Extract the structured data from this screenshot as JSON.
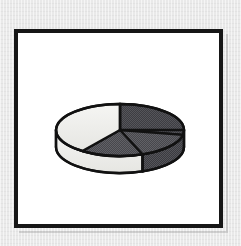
{
  "figure": {
    "kind": "3d-pie-chart-illustration",
    "frame_style": "thick-black-border",
    "background_color": "#e9e9e9",
    "panel_color": "#ffffff",
    "frame_color": "#161616"
  },
  "chart_data": {
    "type": "pie",
    "title": "",
    "subtitle": "",
    "xlabel": "",
    "ylabel": "",
    "three_d": true,
    "legend": "none",
    "grid": false,
    "labels_shown": false,
    "start_angle_deg": 90,
    "direction": "clockwise",
    "categories": [
      "Segment 1",
      "Segment 2",
      "Segment 3"
    ],
    "values": [
      28,
      32,
      40
    ],
    "percentages": [
      "28%",
      "32%",
      "40%"
    ],
    "colors": [
      "#58585a",
      "#6b6b6d",
      "#f0f0ee"
    ],
    "side_colors": [
      "#4a4a4c",
      "#5c5c5e",
      "#f7f7f5"
    ],
    "outline_color": "#111111",
    "geometry": {
      "center_x": 100,
      "center_y": 95,
      "radius_x": 64,
      "radius_y": 26,
      "depth": 17
    },
    "slices": [
      {
        "name": "Segment 1",
        "value": 28,
        "percent": "28%",
        "fill": "#58585a",
        "position": "upper-right"
      },
      {
        "name": "Segment 2",
        "value": 32,
        "percent": "32%",
        "fill": "#6b6b6d",
        "position": "lower-right"
      },
      {
        "name": "Segment 3",
        "value": 40,
        "percent": "40%",
        "fill": "#f0f0ee",
        "position": "left"
      }
    ]
  }
}
